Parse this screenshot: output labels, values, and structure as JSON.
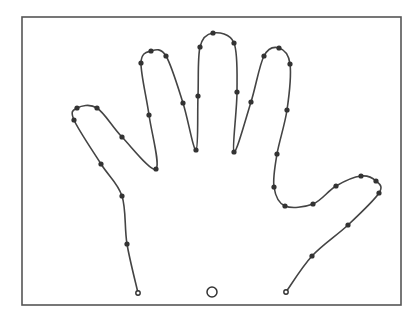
{
  "diagram": {
    "type": "spline-outline",
    "frame": {
      "x": 22,
      "y": 17,
      "width": 379,
      "height": 288,
      "stroke": "#555555"
    },
    "curve_color": "#444444",
    "point_color": "#333333",
    "control_points": [
      [
        138,
        293
      ],
      [
        127,
        244
      ],
      [
        122,
        196
      ],
      [
        101,
        164
      ],
      [
        74,
        120
      ],
      [
        77,
        108
      ],
      [
        97,
        108
      ],
      [
        122,
        137
      ],
      [
        156,
        169
      ],
      [
        149,
        115
      ],
      [
        141,
        63
      ],
      [
        151,
        51
      ],
      [
        166,
        56
      ],
      [
        183,
        103
      ],
      [
        196,
        150
      ],
      [
        198,
        96
      ],
      [
        200,
        47
      ],
      [
        213,
        33
      ],
      [
        234,
        43
      ],
      [
        237,
        92
      ],
      [
        234,
        152
      ],
      [
        251,
        102
      ],
      [
        264,
        56
      ],
      [
        279,
        48
      ],
      [
        290,
        64
      ],
      [
        287,
        110
      ],
      [
        277,
        154
      ],
      [
        274,
        187
      ],
      [
        285,
        206
      ],
      [
        313,
        204
      ],
      [
        336,
        186
      ],
      [
        361,
        176
      ],
      [
        376,
        181
      ],
      [
        379,
        193
      ],
      [
        348,
        225
      ],
      [
        312,
        256
      ],
      [
        286,
        292
      ]
    ],
    "start_point": [
      138,
      293
    ],
    "end_point": [
      286,
      292
    ],
    "marker": {
      "cx": 212,
      "cy": 292,
      "r": 5,
      "shape": "hollow-circle"
    }
  }
}
